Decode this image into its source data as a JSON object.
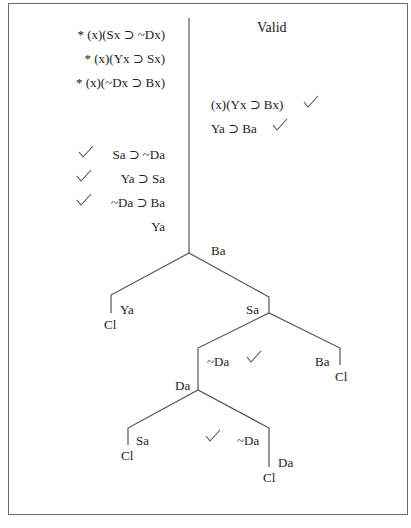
{
  "title": "Valid",
  "premises": [
    "* (x)(Sx ⊃ ~Dx)",
    "* (x)(Yx ⊃ Sx)",
    "* (x)(~Dx ⊃ Bx)"
  ],
  "right_column": [
    {
      "text": "(x)(Yx ⊃ Bx)",
      "checked": true
    },
    {
      "text": "Ya ⊃ Ba",
      "checked": true
    }
  ],
  "left_column": [
    {
      "text": "Sa ⊃ ~Da",
      "checked": true
    },
    {
      "text": "Ya ⊃ Sa",
      "checked": true
    },
    {
      "text": "~Da ⊃ Ba",
      "checked": true
    },
    {
      "text": "Ya",
      "checked": false
    }
  ],
  "tree": {
    "root_label": "Ba",
    "left_branch": {
      "label": "Ya",
      "closed": "Cl"
    },
    "right_branch": {
      "label": "Sa",
      "right": {
        "label": "Ba",
        "closed": "Cl"
      },
      "left": {
        "label": "~Da",
        "checked": true,
        "split_label": "Da",
        "left": {
          "label": "Sa",
          "closed": "Cl"
        },
        "right": {
          "label": "~Da",
          "sub_label": "Da",
          "closed": "Cl"
        },
        "middle_check": true
      }
    }
  }
}
